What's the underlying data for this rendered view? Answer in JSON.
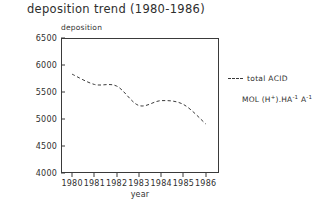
{
  "chart_data": {
    "type": "line",
    "title": "deposition trend (1980-1986)",
    "xlabel": "year",
    "ylabel": "deposition",
    "x": [
      1980,
      1981,
      1982,
      1983,
      1984,
      1985,
      1986
    ],
    "xtick_labels": [
      "1980",
      "1981",
      "1982",
      "1983",
      "1984",
      "1985",
      "1986"
    ],
    "xlim": [
      1979.5,
      1986.6
    ],
    "ylim": [
      4000,
      6500
    ],
    "ytick_labels": [
      "6500",
      "6000",
      "5500",
      "5000",
      "4500",
      "4000"
    ],
    "yticks": [
      6500,
      6000,
      5500,
      5000,
      4500,
      4000
    ],
    "grid": false,
    "legend_position": "right",
    "series": [
      {
        "name": "total ACID",
        "linestyle": "dashed",
        "color": "#3a3a3a",
        "values": [
          5830,
          5640,
          5610,
          5250,
          5340,
          5270,
          4910
        ]
      }
    ],
    "annotations": {
      "units": "MOL (H+).HA-1 A-1",
      "units_parts": {
        "prefix": "MOL (H",
        "charge": "+",
        "middle": ").HA",
        "exp1": "-1",
        "tail": " A",
        "exp2": "-1"
      }
    }
  },
  "legend": {
    "entry_label": "total ACID"
  }
}
